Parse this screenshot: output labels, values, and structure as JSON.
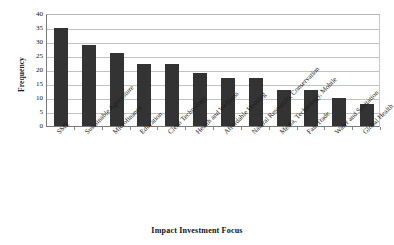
{
  "chart_data": {
    "type": "bar",
    "title": "",
    "xlabel": "Impact Investment Focus",
    "ylabel": "Frequency",
    "ylim": [
      0,
      40
    ],
    "ytick_step": 5,
    "yticks": [
      40,
      35,
      30,
      25,
      20,
      15,
      10,
      5,
      0
    ],
    "grid": "horizontal",
    "legend": "none",
    "bar_color": "#333333",
    "gridline_color": "#c2c2c2",
    "axis_color": "#7a7a7a",
    "categories": [
      "SME",
      "Sustainable Agriculture",
      "Microfinance",
      "Education",
      "Clean Technology",
      "Health and Wellness",
      "Affordable Housing",
      "Natural Resources, Conservation",
      "Media, Technology, Mobile",
      "Fair Trade",
      "Water and Sanitation",
      "Global Health"
    ],
    "values": [
      35,
      29,
      26,
      22,
      22,
      19,
      17,
      17,
      13,
      13,
      10,
      8
    ]
  }
}
